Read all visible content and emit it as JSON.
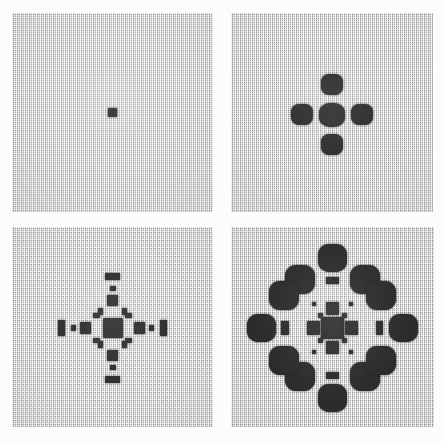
{
  "figure": {
    "background_color": "#fdfdfd",
    "grid_color": "#c4c4c4",
    "cell_color": "#2b2b2b",
    "panel_count": 4,
    "layout": "2x2"
  },
  "panels": [
    {
      "id": "panel-1",
      "label": "Stage 1",
      "generation": 1,
      "x": 12,
      "y": 13,
      "width": 201,
      "height": 199,
      "cell_count": 1,
      "cells": [
        {
          "cx": 100.5,
          "cy": 99.5,
          "w": 9,
          "h": 9,
          "shape": "sharp"
        }
      ]
    },
    {
      "id": "panel-2",
      "label": "Stage 2",
      "generation": 2,
      "x": 231,
      "y": 13,
      "width": 202,
      "height": 199,
      "cell_count": 5,
      "cells": [
        {
          "cx": 100.5,
          "cy": 101.5,
          "w": 26,
          "h": 24,
          "shape": "blob"
        },
        {
          "cx": 100.5,
          "cy": 71.5,
          "w": 22,
          "h": 21,
          "shape": "round"
        },
        {
          "cx": 100.5,
          "cy": 131.5,
          "w": 22,
          "h": 21,
          "shape": "round"
        },
        {
          "cx": 70.5,
          "cy": 101.5,
          "w": 22,
          "h": 21,
          "shape": "round"
        },
        {
          "cx": 130.5,
          "cy": 101.5,
          "w": 22,
          "h": 21,
          "shape": "round"
        }
      ]
    },
    {
      "id": "panel-3",
      "label": "Stage 3",
      "generation": 3,
      "x": 12,
      "y": 227,
      "width": 201,
      "height": 200,
      "cell_count": 21,
      "cells": [
        {
          "cx": 100.5,
          "cy": 100.5,
          "w": 20,
          "h": 19,
          "shape": "sharp"
        },
        {
          "cx": 100.5,
          "cy": 73.5,
          "w": 11,
          "h": 11,
          "shape": "sharp"
        },
        {
          "cx": 100.5,
          "cy": 127.5,
          "w": 11,
          "h": 11,
          "shape": "sharp"
        },
        {
          "cx": 73.5,
          "cy": 100.5,
          "w": 11,
          "h": 11,
          "shape": "sharp"
        },
        {
          "cx": 127.5,
          "cy": 100.5,
          "w": 11,
          "h": 11,
          "shape": "sharp"
        },
        {
          "cx": 88.5,
          "cy": 84.5,
          "w": 5,
          "h": 7,
          "shape": "sharp"
        },
        {
          "cx": 112.5,
          "cy": 84.5,
          "w": 5,
          "h": 7,
          "shape": "sharp"
        },
        {
          "cx": 88.5,
          "cy": 116.5,
          "w": 5,
          "h": 7,
          "shape": "sharp"
        },
        {
          "cx": 112.5,
          "cy": 116.5,
          "w": 5,
          "h": 7,
          "shape": "sharp"
        },
        {
          "cx": 84.5,
          "cy": 88.5,
          "w": 7,
          "h": 5,
          "shape": "sharp"
        },
        {
          "cx": 116.5,
          "cy": 88.5,
          "w": 7,
          "h": 5,
          "shape": "sharp"
        },
        {
          "cx": 84.5,
          "cy": 112.5,
          "w": 7,
          "h": 5,
          "shape": "sharp"
        },
        {
          "cx": 116.5,
          "cy": 112.5,
          "w": 7,
          "h": 5,
          "shape": "sharp"
        },
        {
          "cx": 100.5,
          "cy": 49.5,
          "w": 15,
          "h": 7,
          "shape": "sharp"
        },
        {
          "cx": 100.5,
          "cy": 151.5,
          "w": 15,
          "h": 7,
          "shape": "sharp"
        },
        {
          "cx": 49.5,
          "cy": 100.5,
          "w": 7,
          "h": 15,
          "shape": "sharp"
        },
        {
          "cx": 151.5,
          "cy": 100.5,
          "w": 7,
          "h": 15,
          "shape": "sharp"
        },
        {
          "cx": 100.5,
          "cy": 61.5,
          "w": 6,
          "h": 5,
          "shape": "sharp"
        },
        {
          "cx": 100.5,
          "cy": 139.5,
          "w": 6,
          "h": 5,
          "shape": "sharp"
        },
        {
          "cx": 61.5,
          "cy": 100.5,
          "w": 5,
          "h": 6,
          "shape": "sharp"
        },
        {
          "cx": 139.5,
          "cy": 100.5,
          "w": 5,
          "h": 6,
          "shape": "sharp"
        }
      ]
    },
    {
      "id": "panel-4",
      "label": "Stage 4",
      "generation": 4,
      "x": 231,
      "y": 227,
      "width": 203,
      "height": 200,
      "cell_count": 29,
      "cells": [
        {
          "cx": 100.5,
          "cy": 100.5,
          "w": 22,
          "h": 22,
          "shape": "sharp"
        },
        {
          "cx": 100.5,
          "cy": 81.5,
          "w": 13,
          "h": 13,
          "shape": "sharp"
        },
        {
          "cx": 100.5,
          "cy": 119.5,
          "w": 13,
          "h": 13,
          "shape": "sharp"
        },
        {
          "cx": 81.5,
          "cy": 100.5,
          "w": 13,
          "h": 13,
          "shape": "sharp"
        },
        {
          "cx": 119.5,
          "cy": 100.5,
          "w": 13,
          "h": 13,
          "shape": "sharp"
        },
        {
          "cx": 88.5,
          "cy": 88.5,
          "w": 5,
          "h": 5,
          "shape": "sharp"
        },
        {
          "cx": 112.5,
          "cy": 88.5,
          "w": 5,
          "h": 5,
          "shape": "sharp"
        },
        {
          "cx": 88.5,
          "cy": 112.5,
          "w": 5,
          "h": 5,
          "shape": "sharp"
        },
        {
          "cx": 112.5,
          "cy": 112.5,
          "w": 5,
          "h": 5,
          "shape": "sharp"
        },
        {
          "cx": 82.5,
          "cy": 76.5,
          "w": 4,
          "h": 4,
          "shape": "sharp"
        },
        {
          "cx": 118.5,
          "cy": 76.5,
          "w": 4,
          "h": 4,
          "shape": "sharp"
        },
        {
          "cx": 82.5,
          "cy": 124.5,
          "w": 4,
          "h": 4,
          "shape": "sharp"
        },
        {
          "cx": 118.5,
          "cy": 124.5,
          "w": 4,
          "h": 4,
          "shape": "sharp"
        },
        {
          "cx": 100.5,
          "cy": 30.5,
          "w": 29,
          "h": 28,
          "shape": "round"
        },
        {
          "cx": 100.5,
          "cy": 170.5,
          "w": 29,
          "h": 28,
          "shape": "round"
        },
        {
          "cx": 30.5,
          "cy": 100.5,
          "w": 29,
          "h": 28,
          "shape": "round"
        },
        {
          "cx": 170.5,
          "cy": 100.5,
          "w": 29,
          "h": 28,
          "shape": "round"
        },
        {
          "cx": 68.5,
          "cy": 52.5,
          "w": 30,
          "h": 29,
          "shape": "round"
        },
        {
          "cx": 132.5,
          "cy": 52.5,
          "w": 30,
          "h": 29,
          "shape": "round"
        },
        {
          "cx": 68.5,
          "cy": 148.5,
          "w": 30,
          "h": 29,
          "shape": "round"
        },
        {
          "cx": 132.5,
          "cy": 148.5,
          "w": 30,
          "h": 29,
          "shape": "round"
        },
        {
          "cx": 52.5,
          "cy": 68.5,
          "w": 29,
          "h": 29,
          "shape": "round"
        },
        {
          "cx": 148.5,
          "cy": 68.5,
          "w": 29,
          "h": 29,
          "shape": "round"
        },
        {
          "cx": 52.5,
          "cy": 132.5,
          "w": 29,
          "h": 29,
          "shape": "round"
        },
        {
          "cx": 148.5,
          "cy": 132.5,
          "w": 29,
          "h": 29,
          "shape": "round"
        },
        {
          "cx": 100.5,
          "cy": 53.5,
          "w": 13,
          "h": 7,
          "shape": "sharp"
        },
        {
          "cx": 100.5,
          "cy": 147.5,
          "w": 13,
          "h": 7,
          "shape": "sharp"
        },
        {
          "cx": 53.5,
          "cy": 100.5,
          "w": 7,
          "h": 13,
          "shape": "sharp"
        },
        {
          "cx": 147.5,
          "cy": 100.5,
          "w": 7,
          "h": 13,
          "shape": "sharp"
        }
      ]
    }
  ]
}
